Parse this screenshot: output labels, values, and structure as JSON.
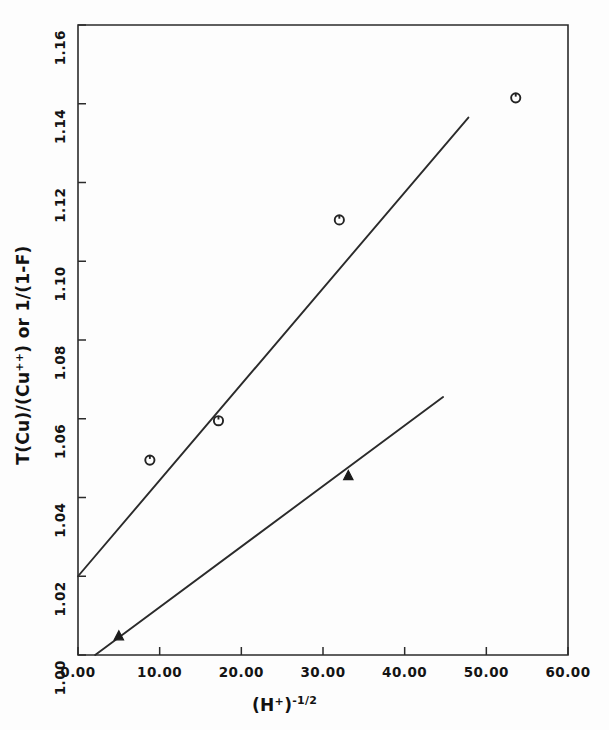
{
  "chart_data": {
    "type": "scatter",
    "title": "",
    "xlabel": "(H+)^-1/2",
    "xlabel_parts": {
      "base": "(H",
      "base_sup": "+",
      "base_close": ")",
      "exponent": "-1/2"
    },
    "ylabel": "T(Cu)/(Cu++) or 1/(1-F)",
    "ylabel_parts": {
      "pre": "T(Cu)/(Cu",
      "sup": "++",
      "post": ") or 1/(1-F)"
    },
    "xlim": [
      0,
      60
    ],
    "ylim": [
      1.0,
      1.16
    ],
    "xticks": [
      0,
      10,
      20,
      30,
      40,
      50,
      60
    ],
    "xtick_labels": [
      "0.00",
      "10.00",
      "20.00",
      "30.00",
      "40.00",
      "50.00",
      "60.00"
    ],
    "yticks": [
      1.0,
      1.02,
      1.04,
      1.06,
      1.08,
      1.1,
      1.12,
      1.14,
      1.16
    ],
    "ytick_labels": [
      "1.00",
      "1.02",
      "1.04",
      "1.06",
      "1.08",
      "1.10",
      "1.12",
      "1.14",
      "1.16"
    ],
    "grid": false,
    "legend": "none",
    "frame": "box",
    "tick_direction": "in",
    "series": [
      {
        "name": "open-circles",
        "marker": "open-circle",
        "x": [
          8.8,
          17.2,
          32.0,
          53.6
        ],
        "y": [
          1.0495,
          1.0595,
          1.1105,
          1.1415
        ],
        "fit_line": {
          "x": [
            0.0,
            47.8
          ],
          "y": [
            1.02,
            1.1365
          ]
        }
      },
      {
        "name": "filled-triangles",
        "marker": "filled-triangle",
        "x": [
          5.0,
          33.1
        ],
        "y": [
          1.0048,
          1.0455
        ],
        "fit_line": {
          "x": [
            2.1,
            44.7
          ],
          "y": [
            1.0,
            1.0655
          ]
        }
      }
    ]
  },
  "axes": {
    "x_axis_name": "x-axis",
    "y_axis_name": "y-axis"
  }
}
